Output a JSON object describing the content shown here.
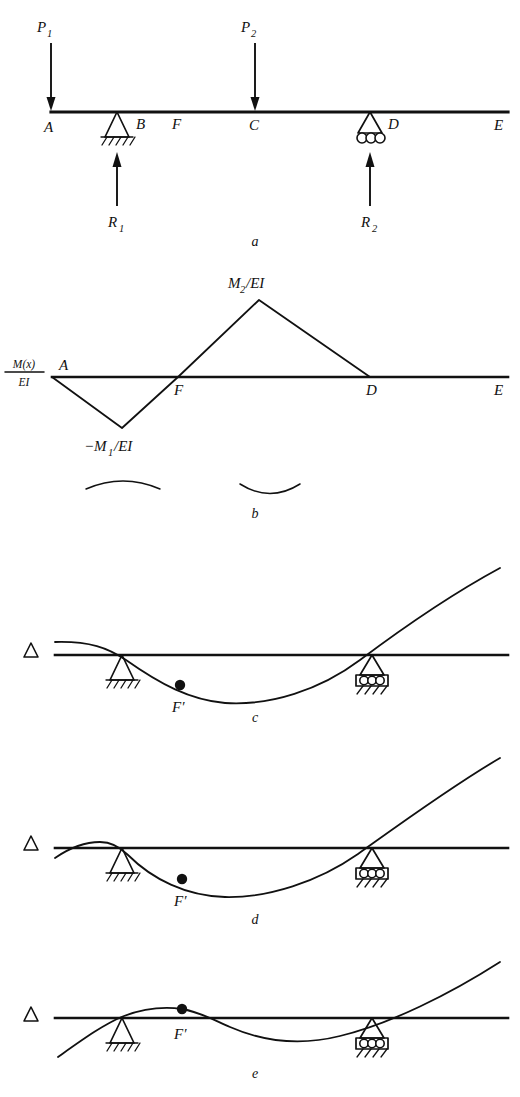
{
  "figure": {
    "stroke_color": "#111111",
    "background": "#ffffff"
  },
  "panels": [
    {
      "id": "a",
      "letter": "a",
      "description": "Overhanging beam with two point loads and two supports",
      "point_labels": [
        "A",
        "B",
        "F",
        "C",
        "D",
        "E"
      ],
      "loads": [
        {
          "name": "P1",
          "base": "P",
          "sub": "1",
          "direction": "down"
        },
        {
          "name": "P2",
          "base": "P",
          "sub": "2",
          "direction": "down"
        }
      ],
      "reactions": [
        {
          "name": "R1",
          "base": "R",
          "sub": "1",
          "direction": "up"
        },
        {
          "name": "R2",
          "base": "R",
          "sub": "2",
          "direction": "up"
        }
      ],
      "supports": [
        {
          "at": "B",
          "type": "pin"
        },
        {
          "at": "D",
          "type": "roller",
          "rollers": 3
        }
      ]
    },
    {
      "id": "b",
      "letter": "b",
      "description": "M(x)/EI bending moment diagram",
      "axis_label": {
        "numerator": "M(x)",
        "denominator": "EI"
      },
      "point_labels": [
        "A",
        "F",
        "D",
        "E"
      ],
      "peak_label": {
        "base": "M",
        "sub": "2",
        "suffix": "/EI"
      },
      "trough_label": {
        "base": "−M",
        "sub": "1",
        "suffix": "/EI"
      },
      "curvature_arcs": [
        "hogging",
        "sagging"
      ]
    },
    {
      "id": "c",
      "letter": "c",
      "description": "Deflected shape, inflection point F' below baseline",
      "delta_symbol": "Δ",
      "inflection_label": "F′",
      "supports": [
        {
          "type": "pin"
        },
        {
          "type": "roller",
          "rollers": 3
        }
      ]
    },
    {
      "id": "d",
      "letter": "d",
      "description": "Deflected shape with small hump at left overhang, inflection point F' below baseline",
      "delta_symbol": "Δ",
      "inflection_label": "F′",
      "supports": [
        {
          "type": "pin"
        },
        {
          "type": "roller",
          "rollers": 3
        }
      ]
    },
    {
      "id": "e",
      "letter": "e",
      "description": "Deflected shape with inflection point F' on baseline",
      "delta_symbol": "Δ",
      "inflection_label": "F′",
      "supports": [
        {
          "type": "pin"
        },
        {
          "type": "roller",
          "rollers": 3
        }
      ]
    }
  ],
  "labels": {
    "A": "A",
    "B": "B",
    "C": "C",
    "D": "D",
    "E": "E",
    "F": "F",
    "F_prime": "F′",
    "delta": "Δ",
    "P": "P",
    "R": "R",
    "M": "M",
    "one": "1",
    "two": "2",
    "M_of_x": "M(x)",
    "EI": "EI",
    "M2_over_EI": "/EI",
    "neg_M": "−M",
    "panel_a": "a",
    "panel_b": "b",
    "panel_c": "c",
    "panel_d": "d",
    "panel_e": "e"
  }
}
